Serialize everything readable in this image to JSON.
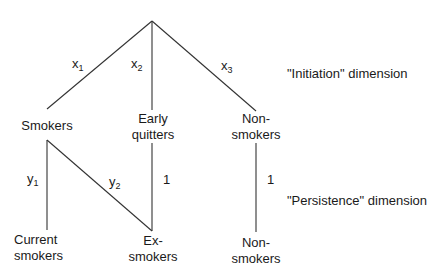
{
  "diagram": {
    "type": "tree",
    "dimensions": {
      "initiation": "\"Initiation\" dimension",
      "persistence": "\"Persistence\" dimension"
    },
    "level1_nodes": {
      "smokers": "Smokers",
      "early_quitters": [
        "Early",
        "quitters"
      ],
      "non_smokers": [
        "Non-",
        "smokers"
      ]
    },
    "level2_nodes": {
      "current_smokers": [
        "Current",
        "smokers"
      ],
      "ex_smokers": [
        "Ex-",
        "smokers"
      ],
      "non_smokers": [
        "Non-",
        "smokers"
      ]
    },
    "edge_labels": {
      "x1": {
        "base": "x",
        "sub": "1"
      },
      "x2": {
        "base": "x",
        "sub": "2"
      },
      "x3": {
        "base": "x",
        "sub": "3"
      },
      "y1": {
        "base": "y",
        "sub": "1"
      },
      "y2": {
        "base": "y",
        "sub": "2"
      },
      "early_to_ex": "1",
      "non_to_non": "1"
    },
    "line_color": "#333333"
  }
}
